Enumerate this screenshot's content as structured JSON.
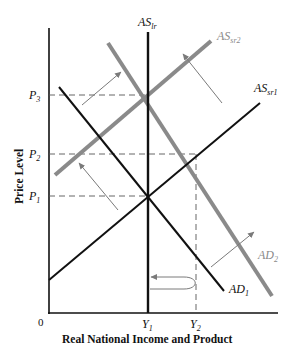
{
  "diagram": {
    "x_axis_title": "Real National Income and Product",
    "y_axis_title": "Price Level",
    "origin_label": "0",
    "y_ticks": [
      {
        "label": "P",
        "sub": "3",
        "y": 95
      },
      {
        "label": "P",
        "sub": "2",
        "y": 154
      },
      {
        "label": "P",
        "sub": "1",
        "y": 196
      }
    ],
    "x_ticks": [
      {
        "label": "Y",
        "sub": "1",
        "x": 148
      },
      {
        "label": "Y",
        "sub": "2",
        "x": 196
      }
    ],
    "curves": [
      {
        "id": "AS_lr",
        "label": "AS",
        "sub": "lr",
        "color": "#111111",
        "type": "vertical"
      },
      {
        "id": "AS_sr1",
        "label": "AS",
        "sub": "sr1",
        "color": "#111111",
        "type": "upward"
      },
      {
        "id": "AS_sr2",
        "label": "AS",
        "sub": "sr2",
        "color": "#8a8a8a",
        "type": "upward"
      },
      {
        "id": "AD_1",
        "label": "AD",
        "sub": "1",
        "color": "#111111",
        "type": "downward"
      },
      {
        "id": "AD_2",
        "label": "AD",
        "sub": "2",
        "color": "#8a8a8a",
        "type": "downward"
      }
    ],
    "equilibria": [
      {
        "name": "initial",
        "price": "P1",
        "output": "Y1"
      },
      {
        "name": "short-run after AD shift",
        "price": "P2",
        "output": "Y2"
      },
      {
        "name": "long-run after AS shift",
        "price": "P3",
        "output": "Y1"
      }
    ],
    "arrows": [
      {
        "description": "AD1 shifts right to AD2"
      },
      {
        "description": "ASsr1 shifts left to ASsr2 (two arrows)"
      },
      {
        "description": "output returns from Y2 to Y1 (curved arrow)"
      }
    ],
    "colors": {
      "primary": "#111111",
      "shifted": "#8a8a8a",
      "dashed": "#555555"
    }
  }
}
